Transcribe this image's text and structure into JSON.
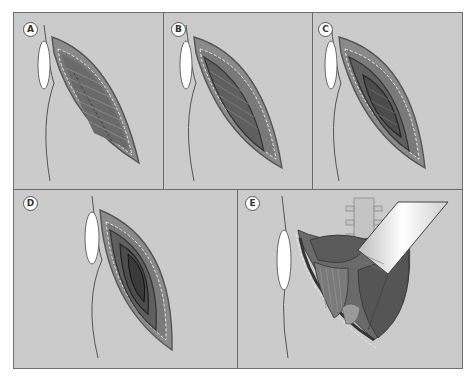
{
  "figure": {
    "colors": {
      "background": "#cbcbcb",
      "border": "#6a6a6a",
      "skin_outline": "#555555",
      "muscle_light": "#8e8e8e",
      "muscle_mid": "#707070",
      "muscle_dark": "#4a4a4a",
      "pad": "#ffffff"
    },
    "panels": [
      {
        "id": "A",
        "label": "A",
        "caption": "Incision through skin exposing external oblique muscle"
      },
      {
        "id": "B",
        "label": "B",
        "caption": "External oblique divided"
      },
      {
        "id": "C",
        "label": "C",
        "caption": "Internal oblique divided"
      },
      {
        "id": "D",
        "label": "D",
        "caption": "Transversus abdominis divided"
      },
      {
        "id": "E",
        "label": "E",
        "caption": "Retraction exposing retroperitoneum and spine"
      }
    ]
  }
}
